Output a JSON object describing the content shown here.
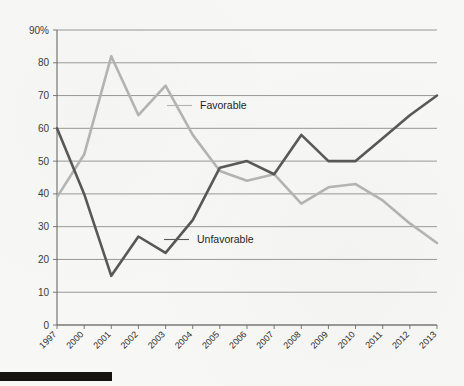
{
  "chart_data": {
    "type": "line",
    "title": "",
    "xlabel": "",
    "ylabel": "",
    "ylim": [
      0,
      90
    ],
    "grid": true,
    "legend_position": "inline-annotation",
    "categories": [
      "1997",
      "2000",
      "2001",
      "2002",
      "2003",
      "2004",
      "2005",
      "2006",
      "2007",
      "2008",
      "2009",
      "2010",
      "2011",
      "2012",
      "2013"
    ],
    "y_ticks": [
      "0",
      "10",
      "20",
      "30",
      "40",
      "50",
      "60",
      "70",
      "80",
      "90%"
    ],
    "y_tick_values": [
      0,
      10,
      20,
      30,
      40,
      50,
      60,
      70,
      80,
      90
    ],
    "series": [
      {
        "name": "Favorable",
        "color": "#b3b3b3",
        "values": [
          39,
          52,
          82,
          64,
          73,
          58,
          47,
          44,
          46,
          37,
          42,
          43,
          38,
          31,
          25
        ]
      },
      {
        "name": "Unfavorable",
        "color": "#585858",
        "values": [
          60,
          40,
          15,
          27,
          22,
          32,
          48,
          50,
          46,
          58,
          50,
          50,
          57,
          64,
          70
        ]
      }
    ],
    "annotations": [
      {
        "text": "Favorable",
        "series": "Favorable",
        "x_px": 200,
        "y_px": 109
      },
      {
        "text": "Unfavorable",
        "series": "Unfavorable",
        "x_px": 197,
        "y_px": 243
      }
    ]
  },
  "figure": {
    "background_color": "#f7f7f5",
    "gridline_color": "#8d8d8d",
    "axis_color": "#6b6b6b",
    "favorable_color": "#b3b3b3",
    "unfavorable_color": "#585858",
    "footer_bar_color": "#15120f"
  }
}
